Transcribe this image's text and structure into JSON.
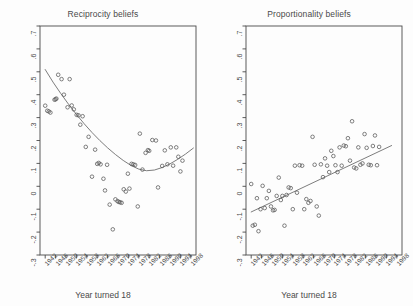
{
  "figure": {
    "background": "#fdfdfd",
    "foreground": "#4a4a4a",
    "point_color": "#555555",
    "line_color": "#666666"
  },
  "chart_data": [
    {
      "type": "scatter",
      "panel": "left",
      "title": "Reciprocity beliefs",
      "xlabel": "Year turned 18",
      "ylabel": "",
      "xlim": [
        1940,
        2000
      ],
      "ylim": [
        -0.3,
        0.7
      ],
      "grid": false,
      "legend": null,
      "ytick_labels": [
        ".7",
        ".6",
        ".5",
        ".4",
        ".3",
        ".2",
        ".1",
        "0",
        "-.1",
        "-.2",
        "-.3"
      ],
      "ytick_values": [
        0.7,
        0.6,
        0.5,
        0.4,
        0.3,
        0.2,
        0.1,
        0.0,
        -0.1,
        -0.2,
        -0.3
      ],
      "xtick_labels": [
        "1942",
        "1946",
        "1950",
        "1954",
        "1958",
        "1962",
        "1966",
        "1970",
        "1974",
        "1978",
        "1982",
        "1986",
        "1990",
        "1994",
        "1998"
      ],
      "xtick_values": [
        1942,
        1946,
        1950,
        1954,
        1958,
        1962,
        1966,
        1970,
        1974,
        1978,
        1982,
        1986,
        1990,
        1994,
        1998
      ],
      "fit": {
        "kind": "quadratic-smooth",
        "x": [
          1942,
          1945,
          1948,
          1951,
          1954,
          1957,
          1960,
          1963,
          1966,
          1969,
          1972,
          1975,
          1978,
          1981,
          1984,
          1987,
          1990,
          1993,
          1996,
          1999
        ],
        "y": [
          0.51,
          0.455,
          0.405,
          0.358,
          0.314,
          0.273,
          0.235,
          0.2,
          0.168,
          0.139,
          0.113,
          0.091,
          0.075,
          0.068,
          0.071,
          0.082,
          0.098,
          0.118,
          0.141,
          0.167
        ]
      },
      "points": [
        {
          "x": 1942.0,
          "y": 0.352
        },
        {
          "x": 1942.8,
          "y": 0.33
        },
        {
          "x": 1943.4,
          "y": 0.327
        },
        {
          "x": 1944.0,
          "y": 0.322
        },
        {
          "x": 1945.6,
          "y": 0.378
        },
        {
          "x": 1946.0,
          "y": 0.38
        },
        {
          "x": 1946.3,
          "y": 0.383
        },
        {
          "x": 1947.0,
          "y": 0.487
        },
        {
          "x": 1948.3,
          "y": 0.468
        },
        {
          "x": 1949.2,
          "y": 0.4
        },
        {
          "x": 1950.6,
          "y": 0.345
        },
        {
          "x": 1951.4,
          "y": 0.468
        },
        {
          "x": 1952.2,
          "y": 0.353
        },
        {
          "x": 1953.0,
          "y": 0.336
        },
        {
          "x": 1954.1,
          "y": 0.312
        },
        {
          "x": 1954.8,
          "y": 0.31
        },
        {
          "x": 1955.5,
          "y": 0.269
        },
        {
          "x": 1956.4,
          "y": 0.306
        },
        {
          "x": 1957.6,
          "y": 0.172
        },
        {
          "x": 1958.7,
          "y": 0.216
        },
        {
          "x": 1960.0,
          "y": 0.042
        },
        {
          "x": 1961.2,
          "y": 0.16
        },
        {
          "x": 1962.0,
          "y": 0.098
        },
        {
          "x": 1962.6,
          "y": 0.102
        },
        {
          "x": 1963.3,
          "y": 0.096
        },
        {
          "x": 1964.4,
          "y": 0.033
        },
        {
          "x": 1965.0,
          "y": -0.018
        },
        {
          "x": 1965.8,
          "y": 0.094
        },
        {
          "x": 1966.8,
          "y": -0.08
        },
        {
          "x": 1968.0,
          "y": -0.188
        },
        {
          "x": 1969.0,
          "y": -0.057
        },
        {
          "x": 1969.8,
          "y": -0.065
        },
        {
          "x": 1970.3,
          "y": -0.068
        },
        {
          "x": 1970.8,
          "y": -0.07
        },
        {
          "x": 1971.4,
          "y": -0.072
        },
        {
          "x": 1972.2,
          "y": -0.013
        },
        {
          "x": 1973.0,
          "y": -0.023
        },
        {
          "x": 1973.8,
          "y": 0.055
        },
        {
          "x": 1974.4,
          "y": -0.01
        },
        {
          "x": 1975.2,
          "y": 0.098
        },
        {
          "x": 1975.9,
          "y": 0.096
        },
        {
          "x": 1976.6,
          "y": 0.093
        },
        {
          "x": 1977.6,
          "y": -0.088
        },
        {
          "x": 1978.4,
          "y": 0.23
        },
        {
          "x": 1979.4,
          "y": 0.073
        },
        {
          "x": 1980.6,
          "y": 0.146
        },
        {
          "x": 1981.5,
          "y": 0.158
        },
        {
          "x": 1982.0,
          "y": 0.155
        },
        {
          "x": 1983.2,
          "y": 0.202
        },
        {
          "x": 1984.6,
          "y": 0.2
        },
        {
          "x": 1985.4,
          "y": -0.005
        },
        {
          "x": 1987.0,
          "y": 0.089
        },
        {
          "x": 1988.0,
          "y": 0.157
        },
        {
          "x": 1989.0,
          "y": 0.096
        },
        {
          "x": 1990.3,
          "y": 0.17
        },
        {
          "x": 1991.2,
          "y": 0.09
        },
        {
          "x": 1992.4,
          "y": 0.17
        },
        {
          "x": 1993.2,
          "y": 0.129
        },
        {
          "x": 1994.0,
          "y": 0.065
        },
        {
          "x": 1994.8,
          "y": 0.112
        }
      ]
    },
    {
      "type": "scatter",
      "panel": "right",
      "title": "Proportionality beliefs",
      "xlabel": "Year turned 18",
      "ylabel": "",
      "xlim": [
        1940,
        2000
      ],
      "ylim": [
        -0.3,
        0.7
      ],
      "grid": false,
      "legend": null,
      "ytick_labels": [
        ".7",
        ".6",
        ".5",
        ".4",
        ".3",
        ".2",
        ".1",
        "0",
        "-.1",
        "-.2",
        "-.3"
      ],
      "ytick_values": [
        0.7,
        0.6,
        0.5,
        0.4,
        0.3,
        0.2,
        0.1,
        0.0,
        -0.1,
        -0.2,
        -0.3
      ],
      "xtick_labels": [
        "1942",
        "1946",
        "1950",
        "1954",
        "1958",
        "1962",
        "1966",
        "1970",
        "1974",
        "1978",
        "1982",
        "1986",
        "1990",
        "1994",
        "1998"
      ],
      "xtick_values": [
        1942,
        1946,
        1950,
        1954,
        1958,
        1962,
        1966,
        1970,
        1974,
        1978,
        1982,
        1986,
        1990,
        1994,
        1998
      ],
      "fit": {
        "kind": "linear",
        "x": [
          1942,
          1996
        ],
        "y": [
          -0.112,
          0.178
        ]
      },
      "points": [
        {
          "x": 1942.0,
          "y": 0.01
        },
        {
          "x": 1942.6,
          "y": -0.172
        },
        {
          "x": 1943.4,
          "y": -0.168
        },
        {
          "x": 1944.2,
          "y": -0.052
        },
        {
          "x": 1944.8,
          "y": -0.196
        },
        {
          "x": 1945.6,
          "y": -0.1
        },
        {
          "x": 1946.4,
          "y": 0.002
        },
        {
          "x": 1947.2,
          "y": -0.095
        },
        {
          "x": 1948.0,
          "y": -0.052
        },
        {
          "x": 1948.8,
          "y": -0.02
        },
        {
          "x": 1949.6,
          "y": -0.088
        },
        {
          "x": 1950.4,
          "y": -0.105
        },
        {
          "x": 1951.0,
          "y": -0.103
        },
        {
          "x": 1951.8,
          "y": -0.042
        },
        {
          "x": 1952.6,
          "y": 0.038
        },
        {
          "x": 1953.4,
          "y": -0.06
        },
        {
          "x": 1954.0,
          "y": -0.042
        },
        {
          "x": 1954.8,
          "y": -0.172
        },
        {
          "x": 1955.6,
          "y": -0.038
        },
        {
          "x": 1956.4,
          "y": -0.005
        },
        {
          "x": 1957.2,
          "y": -0.008
        },
        {
          "x": 1958.0,
          "y": -0.1
        },
        {
          "x": 1958.8,
          "y": 0.09
        },
        {
          "x": 1959.6,
          "y": -0.028
        },
        {
          "x": 1960.6,
          "y": 0.092
        },
        {
          "x": 1961.6,
          "y": 0.09
        },
        {
          "x": 1962.4,
          "y": -0.1
        },
        {
          "x": 1963.2,
          "y": -0.056
        },
        {
          "x": 1964.0,
          "y": -0.072
        },
        {
          "x": 1964.8,
          "y": -0.064
        },
        {
          "x": 1965.6,
          "y": 0.216
        },
        {
          "x": 1966.4,
          "y": 0.094
        },
        {
          "x": 1967.2,
          "y": -0.088
        },
        {
          "x": 1968.0,
          "y": -0.128
        },
        {
          "x": 1968.8,
          "y": 0.096
        },
        {
          "x": 1969.6,
          "y": 0.04
        },
        {
          "x": 1970.4,
          "y": 0.122
        },
        {
          "x": 1971.2,
          "y": 0.09
        },
        {
          "x": 1972.0,
          "y": 0.062
        },
        {
          "x": 1972.8,
          "y": 0.155
        },
        {
          "x": 1973.6,
          "y": 0.132
        },
        {
          "x": 1974.4,
          "y": 0.092
        },
        {
          "x": 1975.2,
          "y": 0.062
        },
        {
          "x": 1976.0,
          "y": 0.17
        },
        {
          "x": 1976.8,
          "y": 0.09
        },
        {
          "x": 1977.6,
          "y": 0.178
        },
        {
          "x": 1978.4,
          "y": 0.175
        },
        {
          "x": 1979.2,
          "y": 0.21
        },
        {
          "x": 1980.0,
          "y": 0.112
        },
        {
          "x": 1980.8,
          "y": 0.284
        },
        {
          "x": 1981.6,
          "y": 0.082
        },
        {
          "x": 1982.4,
          "y": 0.078
        },
        {
          "x": 1983.2,
          "y": 0.17
        },
        {
          "x": 1984.0,
          "y": 0.094
        },
        {
          "x": 1984.8,
          "y": 0.1
        },
        {
          "x": 1985.6,
          "y": 0.228
        },
        {
          "x": 1986.4,
          "y": 0.168
        },
        {
          "x": 1987.2,
          "y": 0.094
        },
        {
          "x": 1988.0,
          "y": 0.092
        },
        {
          "x": 1988.8,
          "y": 0.176
        },
        {
          "x": 1989.6,
          "y": 0.222
        },
        {
          "x": 1990.4,
          "y": 0.092
        },
        {
          "x": 1991.2,
          "y": 0.172
        }
      ]
    }
  ]
}
